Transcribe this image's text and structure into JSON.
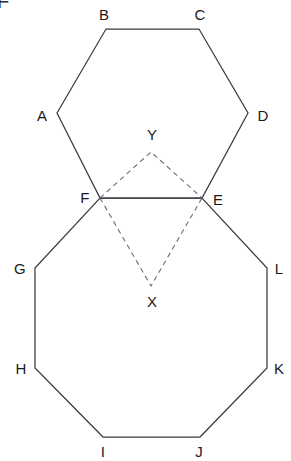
{
  "canvas": {
    "width": 291,
    "height": 461,
    "background": "#ffffff",
    "stroke_color": "#3b3b44",
    "dashed_stroke_color": "#6a6a72",
    "label_color": "#1a1a1a"
  },
  "artifact": {
    "text": "F"
  },
  "figure": {
    "shapes": [
      {
        "name": "hexagon",
        "kind": "regular-hexagon",
        "closed": true,
        "style": "solid",
        "vertices": [
          "A",
          "B",
          "C",
          "D",
          "E",
          "F"
        ]
      },
      {
        "name": "octagon",
        "kind": "regular-octagon",
        "closed": true,
        "style": "solid",
        "vertices": [
          "F",
          "E",
          "L",
          "K",
          "J",
          "I",
          "H",
          "G"
        ]
      },
      {
        "name": "upper-dashed-triangle",
        "kind": "triangle",
        "closed": false,
        "style": "dashed",
        "vertices": [
          "F",
          "Y",
          "E"
        ]
      },
      {
        "name": "lower-dashed-triangle",
        "kind": "triangle",
        "closed": false,
        "style": "dashed",
        "vertices": [
          "F",
          "X",
          "E"
        ]
      }
    ],
    "points": [
      {
        "id": "A",
        "label": "A",
        "x": 57,
        "y": 113,
        "label_x": 42,
        "label_y": 115
      },
      {
        "id": "B",
        "label": "B",
        "x": 106,
        "y": 29,
        "label_x": 104,
        "label_y": 14
      },
      {
        "id": "C",
        "label": "C",
        "x": 199,
        "y": 29,
        "label_x": 200,
        "label_y": 14
      },
      {
        "id": "D",
        "label": "D",
        "x": 248,
        "y": 113,
        "label_x": 263,
        "label_y": 115
      },
      {
        "id": "E",
        "label": "E",
        "x": 202,
        "y": 198,
        "label_x": 218,
        "label_y": 199
      },
      {
        "id": "F",
        "label": "F",
        "x": 100,
        "y": 198,
        "label_x": 85,
        "label_y": 197
      },
      {
        "id": "G",
        "label": "G",
        "x": 35,
        "y": 268,
        "label_x": 20,
        "label_y": 268
      },
      {
        "id": "H",
        "label": "H",
        "x": 35,
        "y": 368,
        "label_x": 21,
        "label_y": 368
      },
      {
        "id": "I",
        "label": "I",
        "x": 103,
        "y": 437,
        "label_x": 103,
        "label_y": 451
      },
      {
        "id": "J",
        "label": "J",
        "x": 200,
        "y": 437,
        "label_x": 199,
        "label_y": 451
      },
      {
        "id": "K",
        "label": "K",
        "x": 267,
        "y": 368,
        "label_x": 279,
        "label_y": 368
      },
      {
        "id": "L",
        "label": "L",
        "x": 267,
        "y": 268,
        "label_x": 279,
        "label_y": 268
      },
      {
        "id": "X",
        "label": "X",
        "x": 151,
        "y": 286,
        "label_x": 152,
        "label_y": 301
      },
      {
        "id": "Y",
        "label": "Y",
        "x": 151,
        "y": 152,
        "label_x": 152,
        "label_y": 134
      }
    ]
  }
}
